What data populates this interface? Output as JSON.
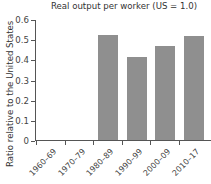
{
  "chart_data": {
    "type": "bar",
    "title": "Real output per worker (US = 1.0)",
    "xlabel": "",
    "ylabel": "Ratio relative to the United States",
    "categories": [
      "1960–69",
      "1970–79",
      "1980–89",
      "1990–99",
      "2000–09",
      "2010–17"
    ],
    "values": [
      null,
      null,
      0.52,
      0.41,
      0.465,
      0.515
    ],
    "ylim": [
      0,
      0.6
    ],
    "yticks": [
      "0",
      "0.1",
      "0.2",
      "0.3",
      "0.4",
      "0.5",
      "0.6"
    ],
    "grid": false,
    "legend": null,
    "bar_color": "#8f8f8f"
  }
}
